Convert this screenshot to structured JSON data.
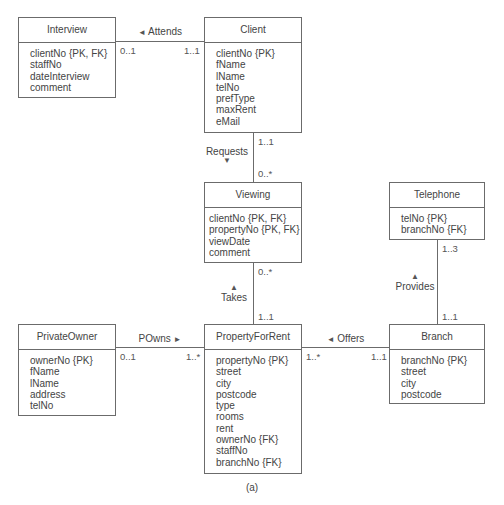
{
  "entities": {
    "interview": {
      "name": "Interview",
      "attributes": [
        "clientNo {PK, FK}",
        "staffNo",
        "dateInterview",
        "comment"
      ]
    },
    "client": {
      "name": "Client",
      "attributes": [
        "clientNo {PK}",
        "fName",
        "lName",
        "telNo",
        "prefType",
        "maxRent",
        "eMail"
      ]
    },
    "viewing": {
      "name": "Viewing",
      "attributes": [
        "clientNo {PK, FK}",
        "propertyNo {PK, FK}",
        "viewDate",
        "comment"
      ]
    },
    "telephone": {
      "name": "Telephone",
      "attributes": [
        "telNo {PK}",
        "branchNo {FK}"
      ]
    },
    "privateowner": {
      "name": "PrivateOwner",
      "attributes": [
        "ownerNo {PK}",
        "fName",
        "lName",
        "address",
        "telNo"
      ]
    },
    "propertyforrent": {
      "name": "PropertyForRent",
      "attributes": [
        "propertyNo {PK}",
        "street",
        "city",
        "postcode",
        "type",
        "rooms",
        "rent",
        "ownerNo {FK}",
        "staffNo",
        "branchNo {FK}"
      ]
    },
    "branch": {
      "name": "Branch",
      "attributes": [
        "branchNo {PK}",
        "street",
        "city",
        "postcode"
      ]
    }
  },
  "relationships": {
    "attends": {
      "label": "Attends",
      "arrow": "◄",
      "mult_left": "0..1",
      "mult_right": "1..1"
    },
    "requests": {
      "label": "Requests",
      "arrow": "▼",
      "mult_top": "1..1",
      "mult_bottom": "0..*"
    },
    "takes": {
      "label": "Takes",
      "arrow": "▲",
      "mult_top": "0..*",
      "mult_bottom": "1..1"
    },
    "provides": {
      "label": "Provides",
      "arrow": "▲",
      "mult_top": "1..3",
      "mult_bottom": "1..1"
    },
    "powns": {
      "label": "POwns",
      "arrow": "►",
      "mult_left": "0..1",
      "mult_right": "1..*"
    },
    "offers": {
      "label": "Offers",
      "arrow": "◄",
      "mult_left": "1..*",
      "mult_right": "1..1"
    }
  },
  "caption": "(a)"
}
